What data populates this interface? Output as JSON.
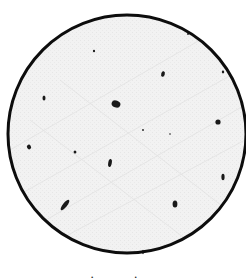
{
  "figure": {
    "background": "#ffffff",
    "field": {
      "shape": "circle",
      "cx": 127,
      "cy": 134,
      "r": 119,
      "fill": "#f1f1f1",
      "stroke": "#0d0d0d",
      "stroke_width": 3
    },
    "spots": [
      {
        "x": 116,
        "y": 104,
        "rx": 4.5,
        "ry": 3.5,
        "rotate": 20,
        "label": "large-cluster"
      },
      {
        "x": 65,
        "y": 205,
        "rx": 2.2,
        "ry": 6.5,
        "rotate": 38,
        "label": "elongated-rod"
      },
      {
        "x": 110,
        "y": 163,
        "rx": 1.8,
        "ry": 4.0,
        "rotate": 10,
        "label": "short-rod"
      },
      {
        "x": 175,
        "y": 204,
        "rx": 2.4,
        "ry": 3.6,
        "rotate": 0,
        "label": "crescent"
      },
      {
        "x": 223,
        "y": 177,
        "rx": 1.6,
        "ry": 3.2,
        "rotate": 0,
        "label": "small-rod"
      },
      {
        "x": 218,
        "y": 122,
        "rx": 2.6,
        "ry": 2.6,
        "rotate": 0,
        "label": "blob"
      },
      {
        "x": 163,
        "y": 74,
        "rx": 1.8,
        "ry": 2.8,
        "rotate": 15,
        "label": "small-blob"
      },
      {
        "x": 223,
        "y": 72,
        "rx": 1.2,
        "ry": 1.4,
        "rotate": 0,
        "label": "dot"
      },
      {
        "x": 44,
        "y": 98,
        "rx": 1.5,
        "ry": 2.6,
        "rotate": 0,
        "label": "caret-mark"
      },
      {
        "x": 29,
        "y": 147,
        "rx": 2.0,
        "ry": 2.4,
        "rotate": -30,
        "label": "small-blob"
      },
      {
        "x": 75,
        "y": 152,
        "rx": 1.4,
        "ry": 1.6,
        "rotate": 0,
        "label": "dot"
      },
      {
        "x": 94,
        "y": 51,
        "rx": 1.1,
        "ry": 1.3,
        "rotate": 0,
        "label": "dot"
      },
      {
        "x": 188,
        "y": 34,
        "rx": 0.9,
        "ry": 0.9,
        "rotate": 0,
        "label": "dot"
      },
      {
        "x": 143,
        "y": 130,
        "rx": 0.9,
        "ry": 0.9,
        "rotate": 0,
        "label": "dot"
      },
      {
        "x": 170,
        "y": 134,
        "rx": 0.8,
        "ry": 0.8,
        "rotate": 0,
        "label": "dot"
      },
      {
        "x": 143,
        "y": 252,
        "rx": 0.8,
        "ry": 2.2,
        "rotate": 0,
        "label": "edge-tick"
      }
    ],
    "spot_color": "#1a1a1a",
    "caption_fragment": "· ·"
  }
}
